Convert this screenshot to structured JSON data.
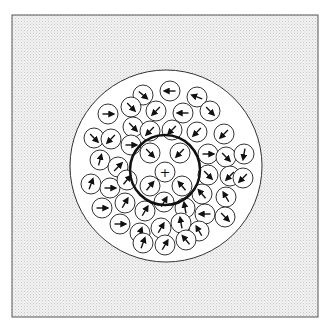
{
  "figure": {
    "type": "particle-flow-diagram",
    "frame": {
      "x": 12,
      "y": 15,
      "width": 306,
      "height": 302,
      "fill": "#e6e6e6",
      "stroke": "#555555"
    },
    "outer_circle": {
      "cx": 166,
      "cy": 166,
      "r": 96,
      "fill": "#ffffff",
      "stroke": "#333333",
      "stroke_width": 1
    },
    "inner_circle": {
      "cx": 165,
      "cy": 170,
      "r": 35,
      "fill": "none",
      "stroke": "#111111",
      "stroke_width": 2.5
    },
    "center_marker": {
      "cx": 165,
      "cy": 172,
      "symbol": "+",
      "label": "+"
    },
    "particle_radius": 10,
    "particles": [
      {
        "cx": 143,
        "cy": 95,
        "angle": 40
      },
      {
        "cx": 170,
        "cy": 91,
        "angle": 180
      },
      {
        "cx": 197,
        "cy": 97,
        "angle": 200
      },
      {
        "cx": 108,
        "cy": 114,
        "angle": 0
      },
      {
        "cx": 131,
        "cy": 107,
        "angle": 45
      },
      {
        "cx": 156,
        "cy": 111,
        "angle": 135
      },
      {
        "cx": 183,
        "cy": 113,
        "angle": 180
      },
      {
        "cx": 210,
        "cy": 111,
        "angle": 45
      },
      {
        "cx": 94,
        "cy": 138,
        "angle": 45
      },
      {
        "cx": 111,
        "cy": 139,
        "angle": 135
      },
      {
        "cx": 133,
        "cy": 127,
        "angle": 45
      },
      {
        "cx": 150,
        "cy": 131,
        "angle": 135
      },
      {
        "cx": 172,
        "cy": 130,
        "angle": 135
      },
      {
        "cx": 197,
        "cy": 132,
        "angle": 135
      },
      {
        "cx": 224,
        "cy": 134,
        "angle": 135
      },
      {
        "cx": 131,
        "cy": 145,
        "angle": 0
      },
      {
        "cx": 150,
        "cy": 153,
        "angle": 45
      },
      {
        "cx": 180,
        "cy": 153,
        "angle": 135
      },
      {
        "cx": 208,
        "cy": 154,
        "angle": 0
      },
      {
        "cx": 226,
        "cy": 157,
        "angle": 45
      },
      {
        "cx": 244,
        "cy": 154,
        "angle": 100
      },
      {
        "cx": 100,
        "cy": 160,
        "angle": -75
      },
      {
        "cx": 118,
        "cy": 167,
        "angle": -45
      },
      {
        "cx": 208,
        "cy": 175,
        "angle": 45
      },
      {
        "cx": 230,
        "cy": 176,
        "angle": 135
      },
      {
        "cx": 243,
        "cy": 178,
        "angle": 135
      },
      {
        "cx": 91,
        "cy": 184,
        "angle": -70
      },
      {
        "cx": 110,
        "cy": 188,
        "angle": 0
      },
      {
        "cx": 127,
        "cy": 180,
        "angle": -50
      },
      {
        "cx": 150,
        "cy": 186,
        "angle": -50
      },
      {
        "cx": 182,
        "cy": 186,
        "angle": -130
      },
      {
        "cx": 202,
        "cy": 194,
        "angle": -130
      },
      {
        "cx": 226,
        "cy": 197,
        "angle": -120
      },
      {
        "cx": 102,
        "cy": 208,
        "angle": 0
      },
      {
        "cx": 125,
        "cy": 203,
        "angle": -60
      },
      {
        "cx": 145,
        "cy": 211,
        "angle": -60
      },
      {
        "cx": 164,
        "cy": 202,
        "angle": -60
      },
      {
        "cx": 185,
        "cy": 208,
        "angle": -100
      },
      {
        "cx": 205,
        "cy": 214,
        "angle": 180
      },
      {
        "cx": 225,
        "cy": 217,
        "angle": 45
      },
      {
        "cx": 120,
        "cy": 224,
        "angle": 0
      },
      {
        "cx": 140,
        "cy": 233,
        "angle": -70
      },
      {
        "cx": 161,
        "cy": 228,
        "angle": -60
      },
      {
        "cx": 181,
        "cy": 223,
        "angle": -100
      },
      {
        "cx": 199,
        "cy": 231,
        "angle": -120
      },
      {
        "cx": 143,
        "cy": 243,
        "angle": -70
      },
      {
        "cx": 165,
        "cy": 245,
        "angle": -60
      },
      {
        "cx": 186,
        "cy": 240,
        "angle": -130
      }
    ]
  }
}
